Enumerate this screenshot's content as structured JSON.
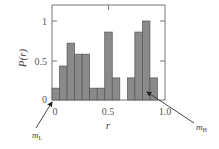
{
  "chart_data": {
    "type": "bar",
    "title": "",
    "xlabel": "r",
    "ylabel": "P(r)",
    "xlim": [
      0,
      1.0
    ],
    "ylim": [
      0,
      1.17
    ],
    "bin_width": 0.0667,
    "x_ticks": [
      "0",
      "0.5",
      "1.0"
    ],
    "y_ticks": [
      "0",
      "0.5",
      "1"
    ],
    "bins_left_edges": [
      0,
      0.067,
      0.133,
      0.2,
      0.267,
      0.333,
      0.4,
      0.467,
      0.533,
      0.6,
      0.667,
      0.733,
      0.8,
      0.867,
      0.933
    ],
    "values": [
      0.15,
      0.43,
      0.72,
      0.58,
      0.58,
      0.15,
      0.15,
      0.86,
      0.28,
      0,
      0.28,
      0.86,
      1.0,
      0.28,
      0
    ],
    "grid": false,
    "bar_color": "#8a8a8a",
    "annotations": [
      {
        "text": "m",
        "sub": "L",
        "points_to_x": 0.0,
        "points_to_y": 0.0
      },
      {
        "text": "m",
        "sub": "H",
        "points_to_x": 0.8,
        "points_to_y": 0.25
      }
    ]
  },
  "labels": {
    "x_axis": "r",
    "y_axis": "P(r)",
    "x_tick_0": "0",
    "x_tick_1": "0.5",
    "x_tick_2": "1.0",
    "y_tick_0": "0",
    "y_tick_1": "0.5",
    "y_tick_2": "1",
    "ann_low_main": "m",
    "ann_low_sub": "L",
    "ann_high_main": "m",
    "ann_high_sub": "H"
  }
}
